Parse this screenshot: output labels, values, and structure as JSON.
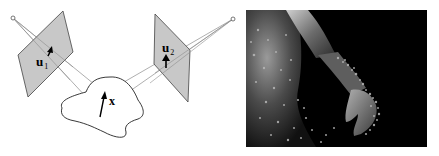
{
  "figure": {
    "diagram": {
      "labels": {
        "u1": "u",
        "u1_sub": "1",
        "u2": "u",
        "u2_sub": "2",
        "x": "x"
      },
      "colors": {
        "plane_fill": "#c8c8c8",
        "stroke": "#444444",
        "ray": "#9a9a9a"
      }
    },
    "render": {
      "description": "rendered 3D human torso and arm with scattered reconstructed point cloud",
      "colors": {
        "background": "#000000",
        "surface": "#8a8a8a",
        "points": "#b8b8b8"
      }
    }
  }
}
